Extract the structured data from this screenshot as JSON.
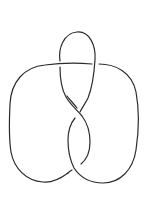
{
  "diagram": {
    "type": "knot-diagram",
    "background": "#ffffff",
    "stroke_color": "#2b2b2b",
    "crossings": 4,
    "regions": [
      "top-loop",
      "left-lobe",
      "right-lobe",
      "central-twist"
    ]
  }
}
